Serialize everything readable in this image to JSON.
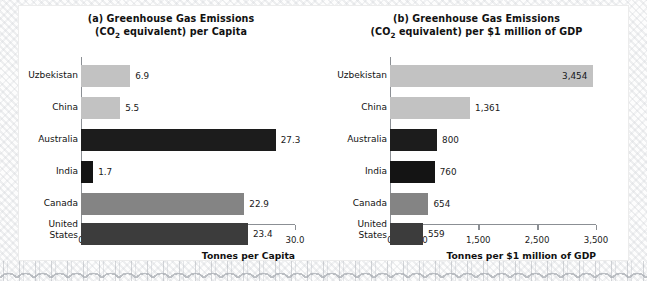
{
  "figure": {
    "background_color": "#ffffff",
    "frame_color": "#ececec"
  },
  "chart_data": [
    {
      "type": "bar",
      "orientation": "horizontal",
      "panel_label": "(a)",
      "title": "(a) Greenhouse Gas Emissions (CO2 equivalent) per Capita",
      "title_line1": "(a) Greenhouse Gas Emissions",
      "title_line2_pre": "(CO",
      "title_line2_sub": "2",
      "title_line2_post": " equivalent) per Capita",
      "categories": [
        "Uzbekistan",
        "China",
        "Australia",
        "India",
        "Canada",
        "United States"
      ],
      "values": [
        6.9,
        5.5,
        27.3,
        1.7,
        22.9,
        23.4
      ],
      "value_labels": [
        "6.9",
        "5.5",
        "27.3",
        "1.7",
        "22.9",
        "23.4"
      ],
      "bar_colors": [
        "#c2c2c2",
        "#c2c2c2",
        "#1c1c1c",
        "#141414",
        "#848484",
        "#3c3c3c"
      ],
      "label_placement": [
        "outside",
        "outside",
        "outside",
        "outside",
        "outside",
        "outside"
      ],
      "xlabel": "Tonnes per Capita",
      "ylabel": "",
      "xlim": [
        0,
        30
      ],
      "xticks": [
        0,
        10,
        20,
        30
      ],
      "xtick_labels": [
        "0",
        "10.0",
        "20.0",
        "30.0"
      ],
      "grid": false,
      "legend": "none"
    },
    {
      "type": "bar",
      "orientation": "horizontal",
      "panel_label": "(b)",
      "title": "(b) Greenhouse Gas Emissions (CO2 equivalent) per $1 million of GDP",
      "title_line1": "(b) Greenhouse Gas Emissions",
      "title_line2_pre": "(CO",
      "title_line2_sub": "2",
      "title_line2_post": " equivalent) per $1 million of GDP",
      "categories": [
        "Uzbekistan",
        "China",
        "Australia",
        "India",
        "Canada",
        "United States"
      ],
      "values": [
        3454,
        1361,
        800,
        760,
        654,
        559
      ],
      "value_labels": [
        "3,454",
        "1,361",
        "800",
        "760",
        "654",
        "559"
      ],
      "bar_colors": [
        "#c2c2c2",
        "#c2c2c2",
        "#1c1c1c",
        "#141414",
        "#848484",
        "#3c3c3c"
      ],
      "label_placement": [
        "inside",
        "outside",
        "outside",
        "outside",
        "outside",
        "outside"
      ],
      "xlabel": "Tonnes per $1 million of GDP",
      "ylabel": "",
      "xlim": [
        0,
        3500
      ],
      "xticks": [
        0,
        500,
        1500,
        2500,
        3500
      ],
      "xtick_labels": [
        "0",
        "500",
        "1,500",
        "2,500",
        "3,500"
      ],
      "grid": false,
      "legend": "none"
    }
  ]
}
